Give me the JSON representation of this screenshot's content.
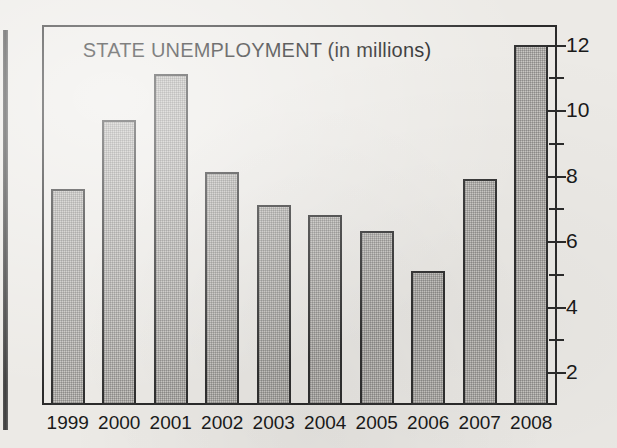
{
  "chart_data": {
    "type": "bar",
    "title": "STATE UNEMPLOYMENT (in millions)",
    "xlabel": "",
    "ylabel": "",
    "categories": [
      "1999",
      "2000",
      "2001",
      "2002",
      "2003",
      "2004",
      "2005",
      "2006",
      "2007",
      "2008"
    ],
    "values": [
      7.6,
      9.7,
      11.1,
      8.1,
      7.1,
      6.8,
      6.3,
      5.1,
      7.9,
      12.0
    ],
    "ylim": [
      1,
      12.6
    ],
    "y_major_ticks": [
      2,
      4,
      6,
      8,
      10,
      12
    ],
    "y_minor_ticks": [
      3,
      5,
      7,
      9,
      11
    ],
    "y_tick_labels": [
      "2",
      "4",
      "6",
      "8",
      "10",
      "12"
    ],
    "grid": false,
    "legend": false,
    "bar_fill": "#c8c6c2",
    "bar_outline": "#303030",
    "frame_color": "#2b2b2b",
    "background": "#eceae6"
  }
}
